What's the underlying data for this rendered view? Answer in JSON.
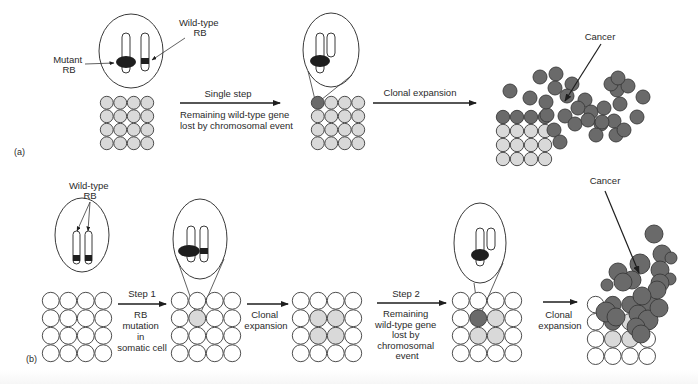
{
  "colors": {
    "background": "#ffffff",
    "outline": "#3a3a3a",
    "normal_cell": "#ffffff",
    "het_cell": "#d9d9d9",
    "tumor_cell": "#6a6a6a",
    "mutant_blob": "#1e1e1e",
    "wildtype_band": "#1e1e1e",
    "text": "#2a2a2a"
  },
  "panel_a": {
    "label": "(a)",
    "callouts": {
      "mutant_rb": [
        "Mutant",
        "RB"
      ],
      "wild_type_rb": [
        "Wild-type",
        "RB"
      ],
      "cancer": "Cancer"
    },
    "steps": [
      {
        "above": "Single step",
        "below": [
          "Remaining wild-type gene",
          "lost by chromosomal event"
        ]
      },
      {
        "above": "Clonal expansion",
        "below": []
      }
    ]
  },
  "panel_b": {
    "label": "(b)",
    "callouts": {
      "wild_type_rb": [
        "Wild-type",
        "RB"
      ],
      "cancer": "Cancer"
    },
    "steps": [
      {
        "above": "Step 1",
        "below": [
          "RB",
          "mutation",
          "in",
          "somatic cell"
        ]
      },
      {
        "above": "",
        "below": [
          "Clonal",
          "expansion"
        ]
      },
      {
        "above": "Step 2",
        "below": [
          "Remaining",
          "wild-type gene",
          "lost by",
          "chromosomal",
          "event"
        ]
      },
      {
        "above": "",
        "below": [
          "Clonal",
          "expansion"
        ]
      }
    ]
  },
  "grids": [
    {
      "id": "a1",
      "x": 100,
      "y": 96,
      "d": 13.5,
      "cells": [
        "h",
        "h",
        "h",
        "h",
        "h",
        "h",
        "h",
        "h",
        "h",
        "h",
        "h",
        "h",
        "h",
        "h",
        "h",
        "h"
      ]
    },
    {
      "id": "a2",
      "x": 311,
      "y": 96,
      "d": 13.5,
      "cells": [
        "t",
        "h",
        "h",
        "h",
        "h",
        "h",
        "h",
        "h",
        "h",
        "h",
        "h",
        "h",
        "h",
        "h",
        "h",
        "h"
      ]
    },
    {
      "id": "a3",
      "x": 496,
      "y": 110,
      "d": 14,
      "cells": [
        "t",
        "t",
        "t",
        "t",
        "h",
        "h",
        "h",
        "h",
        "h",
        "h",
        "h",
        "h",
        "h",
        "h",
        "h",
        "h"
      ]
    },
    {
      "id": "b1",
      "x": 42,
      "y": 292,
      "d": 17.5,
      "cells": [
        "n",
        "n",
        "n",
        "n",
        "n",
        "n",
        "n",
        "n",
        "n",
        "n",
        "n",
        "n",
        "n",
        "n",
        "n",
        "n"
      ]
    },
    {
      "id": "b2",
      "x": 171,
      "y": 292,
      "d": 17.5,
      "cells": [
        "n",
        "n",
        "n",
        "n",
        "n",
        "h",
        "n",
        "n",
        "n",
        "n",
        "n",
        "n",
        "n",
        "n",
        "n",
        "n"
      ]
    },
    {
      "id": "b3",
      "x": 292,
      "y": 292,
      "d": 17.5,
      "cells": [
        "n",
        "n",
        "n",
        "n",
        "n",
        "h",
        "h",
        "n",
        "n",
        "h",
        "h",
        "n",
        "n",
        "n",
        "n",
        "n"
      ]
    },
    {
      "id": "b4",
      "x": 452,
      "y": 292,
      "d": 17.5,
      "cells": [
        "n",
        "n",
        "n",
        "n",
        "n",
        "t",
        "h",
        "n",
        "n",
        "h",
        "h",
        "n",
        "n",
        "n",
        "n",
        "n"
      ]
    },
    {
      "id": "b5",
      "x": 587,
      "y": 296,
      "d": 17.2,
      "cells": [
        "n",
        "t",
        "t",
        "t",
        "n",
        "t",
        "h",
        "t",
        "n",
        "h",
        "h",
        "n",
        "n",
        "n",
        "n",
        "n"
      ]
    }
  ],
  "tumor_clusters": {
    "a": [
      [
        510,
        91,
        7
      ],
      [
        540,
        77,
        7
      ],
      [
        556,
        74,
        7
      ],
      [
        555,
        88,
        7
      ],
      [
        572,
        84,
        7
      ],
      [
        567,
        96,
        7
      ],
      [
        585,
        100,
        7
      ],
      [
        578,
        108,
        7
      ],
      [
        591,
        112,
        7
      ],
      [
        604,
        108,
        7
      ],
      [
        565,
        116,
        7
      ],
      [
        575,
        124,
        7
      ],
      [
        588,
        120,
        7
      ],
      [
        601,
        124,
        7
      ],
      [
        614,
        121,
        7
      ],
      [
        620,
        104,
        7
      ],
      [
        617,
        90,
        7
      ],
      [
        611,
        84,
        7
      ],
      [
        628,
        86,
        7
      ],
      [
        616,
        135,
        7
      ],
      [
        624,
        130,
        7
      ],
      [
        637,
        117,
        7
      ],
      [
        643,
        97,
        7
      ],
      [
        618,
        78,
        7
      ],
      [
        602,
        122,
        7
      ],
      [
        596,
        135,
        7
      ],
      [
        554,
        130,
        7
      ],
      [
        560,
        142,
        7
      ],
      [
        547,
        115,
        7
      ],
      [
        530,
        98,
        7
      ],
      [
        546,
        102,
        7
      ]
    ],
    "b": [
      [
        654,
        234,
        9
      ],
      [
        662,
        254,
        9
      ],
      [
        671,
        258,
        6
      ],
      [
        660,
        270,
        9
      ],
      [
        640,
        264,
        10
      ],
      [
        632,
        280,
        9
      ],
      [
        618,
        272,
        9
      ],
      [
        623,
        282,
        9
      ],
      [
        607,
        285,
        6
      ],
      [
        670,
        279,
        6
      ],
      [
        660,
        283,
        9
      ],
      [
        649,
        303,
        9
      ],
      [
        638,
        314,
        9
      ],
      [
        648,
        320,
        10
      ],
      [
        659,
        308,
        9
      ],
      [
        657,
        290,
        9
      ],
      [
        642,
        296,
        9
      ],
      [
        606,
        312,
        10
      ],
      [
        616,
        317,
        9
      ],
      [
        636,
        327,
        9
      ],
      [
        641,
        334,
        9
      ]
    ]
  },
  "magnifiers": [
    {
      "id": "a1",
      "cx": 131,
      "cy": 51,
      "rx": 32,
      "ry": 37
    },
    {
      "id": "a2",
      "cx": 331,
      "cy": 50,
      "rx": 28,
      "ry": 37
    },
    {
      "id": "b1",
      "cx": 82,
      "cy": 235,
      "rx": 27,
      "ry": 37
    },
    {
      "id": "b2",
      "cx": 200,
      "cy": 239,
      "rx": 27,
      "ry": 40
    },
    {
      "id": "b4",
      "cx": 480,
      "cy": 243,
      "rx": 26,
      "ry": 40
    }
  ]
}
